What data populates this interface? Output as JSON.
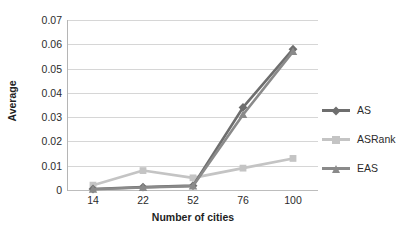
{
  "chart_data": {
    "type": "line",
    "title": "",
    "xlabel": "Number of cities",
    "ylabel": "Average",
    "categories": [
      "14",
      "22",
      "52",
      "76",
      "100"
    ],
    "ylim": [
      0,
      0.07
    ],
    "yticks": [
      "0",
      "0.01",
      "0.02",
      "0.03",
      "0.04",
      "0.05",
      "0.06",
      "0.07"
    ],
    "ytick_values": [
      0,
      0.01,
      0.02,
      0.03,
      0.04,
      0.05,
      0.06,
      0.07
    ],
    "grid": "horizontal",
    "legend_position": "right",
    "series": [
      {
        "name": "AS",
        "color": "#6e6e6e",
        "marker": "diamond",
        "values": [
          0.0004,
          0.0012,
          0.0018,
          0.034,
          0.058
        ]
      },
      {
        "name": "ASRank",
        "color": "#c4c4c4",
        "marker": "square",
        "values": [
          0.002,
          0.008,
          0.005,
          0.009,
          0.013
        ]
      },
      {
        "name": "EAS",
        "color": "#8a8a8a",
        "marker": "triangle",
        "values": [
          0.0003,
          0.001,
          0.0016,
          0.031,
          0.057
        ]
      }
    ]
  },
  "legend": {
    "items": [
      {
        "label": "AS"
      },
      {
        "label": "ASRank"
      },
      {
        "label": "EAS"
      }
    ]
  }
}
